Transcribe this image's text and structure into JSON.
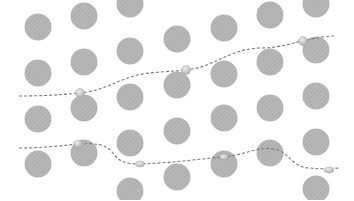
{
  "diagram": {
    "width": 354,
    "height": 200,
    "background": "#ffffff",
    "circle_color": "#b8b8b8",
    "hatch_color": "#a4a4a4",
    "path_color": "#7a7a7a",
    "bead_color": "#c9c9c9",
    "bead_stroke": "#a0a0a0",
    "circle_radius": 13.5,
    "circles": [
      {
        "cx": 38,
        "cy": 27
      },
      {
        "cx": 38,
        "cy": 73
      },
      {
        "cx": 38,
        "cy": 119
      },
      {
        "cx": 38,
        "cy": 164
      },
      {
        "cx": 84,
        "cy": 16
      },
      {
        "cx": 84,
        "cy": 62
      },
      {
        "cx": 84,
        "cy": 108
      },
      {
        "cx": 84,
        "cy": 153
      },
      {
        "cx": 130,
        "cy": 4
      },
      {
        "cx": 130,
        "cy": 51
      },
      {
        "cx": 130,
        "cy": 97
      },
      {
        "cx": 130,
        "cy": 143
      },
      {
        "cx": 130,
        "cy": 191
      },
      {
        "cx": 177,
        "cy": 39
      },
      {
        "cx": 177,
        "cy": 85
      },
      {
        "cx": 177,
        "cy": 131
      },
      {
        "cx": 177,
        "cy": 177
      },
      {
        "cx": 224,
        "cy": 28
      },
      {
        "cx": 224,
        "cy": 74
      },
      {
        "cx": 224,
        "cy": 118
      },
      {
        "cx": 224,
        "cy": 164
      },
      {
        "cx": 270,
        "cy": 15
      },
      {
        "cx": 270,
        "cy": 62
      },
      {
        "cx": 270,
        "cy": 108
      },
      {
        "cx": 270,
        "cy": 153
      },
      {
        "cx": 316,
        "cy": 4
      },
      {
        "cx": 316,
        "cy": 50
      },
      {
        "cx": 316,
        "cy": 96
      },
      {
        "cx": 316,
        "cy": 142
      },
      {
        "cx": 316,
        "cy": 189
      }
    ],
    "paths": [
      {
        "name": "upper-trajectory",
        "d": "M19,96 C40,96 60,95 80,93 C110,90 120,76 150,73 C170,71 178,71 186,70 C215,67 230,48 262,48 C285,47 295,42 303,41 C315,38 325,36 334,36",
        "beads": [
          {
            "cx": 80,
            "cy": 93,
            "rx": 4.5,
            "ry": 4.5
          },
          {
            "cx": 186,
            "cy": 70,
            "rx": 4.5,
            "ry": 4.5
          },
          {
            "cx": 303,
            "cy": 41,
            "rx": 4.5,
            "ry": 4.5
          }
        ]
      },
      {
        "name": "lower-trajectory",
        "d": "M19,148 C40,148 60,146 78,144 C95,143 106,144 112,152 C118,160 122,164 140,164 C170,163 200,159 224,157 C245,155 258,146 274,149 C290,152 292,168 310,168 C318,169 325,169 340,168",
        "beads": [
          {
            "cx": 78,
            "cy": 144,
            "rx": 4.5,
            "ry": 3.5
          },
          {
            "cx": 140,
            "cy": 164,
            "rx": 4.5,
            "ry": 3
          },
          {
            "cx": 224,
            "cy": 157,
            "rx": 4.5,
            "ry": 3
          },
          {
            "cx": 329,
            "cy": 170,
            "rx": 5,
            "ry": 3
          }
        ]
      }
    ]
  }
}
